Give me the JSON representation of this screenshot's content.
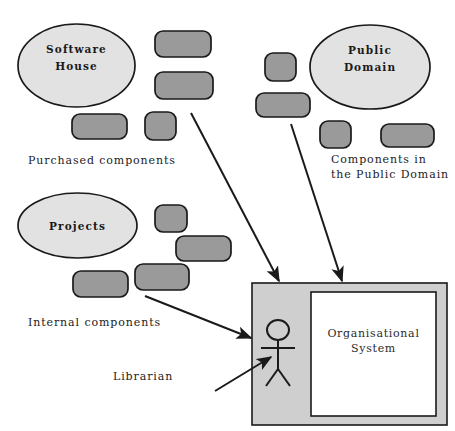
{
  "diagram": {
    "colors": {
      "ellipse_fill": "#e2e2e2",
      "component_fill": "#9a9a9a",
      "system_outer_fill": "#cfcfcf",
      "system_inner_fill": "#ffffff",
      "stroke": "#1a1a1a",
      "background": "#ffffff"
    },
    "sources": [
      {
        "id": "software-house",
        "label_line1": "Software",
        "label_line2": "House",
        "caption": "Purchased components",
        "component_count": 4
      },
      {
        "id": "public-domain",
        "label_line1": "Public",
        "label_line2": "Domain",
        "caption_line1": "Components in",
        "caption_line2": "the Public Domain",
        "component_count": 4
      },
      {
        "id": "projects",
        "label_line1": "Projects",
        "label_line2": "",
        "caption": "Internal components",
        "component_count": 4
      }
    ],
    "system": {
      "label_line1": "Organisational",
      "label_line2": "System",
      "actor_label": "Librarian"
    },
    "flows": [
      {
        "from": "software-house",
        "to": "organisational-system"
      },
      {
        "from": "public-domain",
        "to": "organisational-system"
      },
      {
        "from": "projects",
        "to": "librarian-actor"
      },
      {
        "from": "librarian-label",
        "to": "librarian-actor"
      }
    ]
  }
}
